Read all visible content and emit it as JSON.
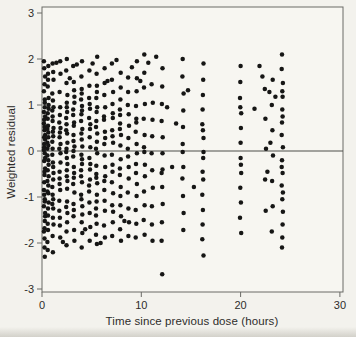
{
  "figure": {
    "page_background": "#f3f2ed",
    "plot_background": "#f7f6f1",
    "axis_color": "#6a6a66",
    "zero_line_color": "#4e4e4a",
    "marker_color": "#161615",
    "text_color": "#2e2d2b",
    "marker_radius": 2.25
  },
  "chart_data": {
    "type": "scatter",
    "title": "",
    "xlabel": "Time since previous dose (hours)",
    "ylabel": "Weighted residual",
    "xlim": [
      0,
      30
    ],
    "ylim": [
      -3,
      3
    ],
    "grid": false,
    "legend": "none",
    "reference_line_y": 0,
    "x_ticks": [
      0,
      10,
      20,
      30
    ],
    "x_tick_labels": [
      "0",
      "10",
      "20",
      "30"
    ],
    "y_ticks": [
      3,
      2,
      1,
      0,
      -1,
      -2,
      -3
    ],
    "y_tick_labels": [
      "3",
      "2",
      "1",
      "0",
      "-1",
      "-2",
      "-3"
    ],
    "clusters": [
      {
        "x": 0.25,
        "y": [
          1.95,
          -0.52,
          1.62,
          0.08,
          -1.05,
          1.3,
          -1.68,
          0.75,
          -0.22,
          1.12,
          -0.85,
          0.45,
          -1.35,
          1.8,
          -0.05,
          0.6,
          -1.9,
          0.25,
          -0.68,
          0.95,
          -1.2,
          1.45,
          -0.38,
          0.15,
          -1.52,
          0.85,
          -2.1,
          0.35,
          -0.95,
          1.05,
          -1.75,
          0.52,
          -0.15,
          0.68,
          -1.1,
          0.02,
          -0.45,
          -1.42,
          0.3,
          -2.3
        ]
      },
      {
        "x": 0.6,
        "y": [
          1.85,
          -1.98,
          0.55,
          -0.3,
          1.4,
          -0.75,
          0.18,
          -1.25,
          0.92,
          -1.58,
          0.4,
          -0.1,
          1.68,
          -0.55,
          0.7,
          -0.92,
          0.05,
          -1.4,
          1.15,
          -2.15,
          0.3,
          -0.65,
          1.55,
          -1.12,
          0.82,
          -0.2,
          0.48,
          -1.72,
          1.0,
          -0.42,
          0.12,
          -0.88
        ]
      },
      {
        "x": 1.1,
        "y": [
          1.9,
          -0.62,
          1.25,
          -1.45,
          0.5,
          0.05,
          -1.05,
          0.88,
          -0.25,
          1.55,
          -1.85,
          0.32,
          -0.78,
          1.1,
          -0.48,
          0.65,
          -1.25,
          0.2,
          -2.2,
          0.95,
          -0.95,
          1.72,
          -0.08,
          0.42,
          -1.6,
          0.75,
          -0.35,
          -1.15
        ]
      },
      {
        "x": 1.8,
        "y": [
          1.68,
          -0.45,
          0.95,
          -1.3,
          0.4,
          -0.05,
          1.28,
          -0.85,
          0.62,
          -1.62,
          0.15,
          -0.6,
          1.95,
          -1.08,
          0.78,
          -0.25,
          0.3,
          -1.88,
          0.05,
          -1.45,
          0.5,
          -0.72
        ]
      },
      {
        "x": 2.5,
        "y": [
          2.0,
          -0.28,
          1.48,
          -1.1,
          0.72,
          -0.55,
          1.22,
          -1.75,
          0.38,
          -0.02,
          0.95,
          -1.35,
          0.58,
          -0.82,
          1.75,
          -0.42,
          0.18,
          -2.05,
          0.85,
          -1.22,
          1.05,
          -0.65,
          0.05,
          -1.55,
          0.45,
          -0.15
        ]
      },
      {
        "x": 3.2,
        "y": [
          1.85,
          -0.58,
          1.18,
          -1.42,
          0.62,
          -0.12,
          1.5,
          -0.9,
          0.35,
          -1.72,
          0.9,
          -0.35,
          0.1,
          -1.15,
          1.32,
          -0.72,
          0.55,
          -1.95,
          0.22,
          -0.48,
          0.78,
          -1.28,
          1.05,
          0.0
        ]
      },
      {
        "x": 4.0,
        "y": [
          1.95,
          -0.42,
          1.35,
          -1.2,
          0.8,
          -0.68,
          1.12,
          -1.55,
          0.48,
          -0.08,
          0.98,
          -0.95,
          0.25,
          -1.78,
          1.62,
          -0.28,
          0.65,
          -2.1,
          0.1,
          -1.05,
          0.88,
          -0.55,
          1.25,
          -1.38,
          0.38,
          -0.18
        ]
      },
      {
        "x": 4.8,
        "y": [
          1.75,
          -0.62,
          1.15,
          -1.35,
          0.58,
          -0.15,
          0.92,
          -0.88,
          0.3,
          -1.65,
          1.42,
          -0.4,
          0.72,
          -1.95,
          0.08,
          -1.12,
          0.48,
          -0.75,
          1.02,
          -0.28
        ]
      },
      {
        "x": 5.5,
        "y": [
          2.05,
          -0.5,
          1.42,
          -1.25,
          0.85,
          -0.05,
          1.15,
          -0.95,
          0.52,
          -1.58,
          0.95,
          -0.32,
          0.2,
          -1.82,
          1.68,
          -0.7,
          0.65,
          -2.02,
          0.05,
          -1.1,
          0.38,
          -0.58,
          1.28,
          -1.4
        ]
      },
      {
        "x": 6.3,
        "y": [
          1.8,
          -0.55,
          1.22,
          -1.3,
          0.68,
          -0.1,
          0.95,
          -0.85,
          0.42,
          -1.62,
          1.48,
          -0.35,
          0.15,
          -1.88,
          0.75,
          -1.08,
          0.28,
          -0.65
        ]
      },
      {
        "x": 7.1,
        "y": [
          1.9,
          -0.45,
          1.28,
          -1.18,
          0.72,
          -0.08,
          1.02,
          -0.92,
          0.45,
          -1.55,
          1.55,
          -0.3,
          0.18,
          -1.85,
          0.82,
          -0.68,
          0.32,
          -1.32
        ]
      },
      {
        "x": 7.9,
        "y": [
          1.7,
          -0.52,
          1.12,
          -1.42,
          0.6,
          -0.18,
          0.9,
          -0.98,
          0.35,
          -1.7,
          1.38,
          -0.38,
          0.12,
          -1.95,
          0.78,
          -0.78,
          0.48,
          -1.18
        ]
      },
      {
        "x": 8.7,
        "y": [
          1.6,
          -0.6,
          1.0,
          -1.25,
          0.55,
          -0.12,
          0.8,
          -0.9,
          0.28,
          -1.55,
          1.28,
          -0.35,
          0.05,
          -1.85
        ]
      },
      {
        "x": 9.5,
        "y": [
          1.95,
          -0.48,
          1.3,
          -1.28,
          0.7,
          -0.05,
          0.98,
          -0.98,
          0.42,
          -1.58,
          1.58,
          -0.28,
          0.15,
          -1.88,
          0.62,
          -0.72
        ]
      },
      {
        "x": 10.3,
        "y": [
          2.1,
          -0.55,
          1.38,
          -1.18,
          0.7,
          -0.02,
          1.02,
          -0.88,
          0.35,
          -1.5,
          1.7,
          -0.3,
          0.08,
          -1.82
        ]
      },
      {
        "x": 11.1,
        "y": [
          1.45,
          -0.42,
          1.05,
          -1.2,
          0.68,
          -0.05,
          0.32,
          -0.8,
          -1.6,
          -1.95
        ]
      },
      {
        "x": 12.1,
        "y": [
          1.8,
          -0.48,
          1.4,
          -1.15,
          1.02,
          -0.05,
          0.65,
          -0.78,
          0.3,
          -1.55,
          -0.4,
          -1.95,
          -2.68
        ]
      },
      {
        "x": 14.2,
        "y": [
          2.0,
          -0.35,
          1.62,
          -0.98,
          1.25,
          -0.02,
          0.88,
          -0.6,
          0.52,
          -1.35,
          0.15,
          -1.72
        ]
      },
      {
        "x": 16.2,
        "y": [
          1.9,
          -0.45,
          1.55,
          -0.95,
          1.22,
          -0.02,
          0.9,
          -0.62,
          0.58,
          -1.28,
          0.28,
          -1.6,
          -0.15,
          -1.92,
          0.45,
          -2.27
        ]
      },
      {
        "x": 20.0,
        "y": [
          1.85,
          -0.48,
          1.5,
          -1.12,
          1.15,
          -0.15,
          0.82,
          -0.8,
          0.5,
          -1.45,
          0.18,
          -1.78,
          0.95,
          -0.3
        ]
      },
      {
        "x": 22.5,
        "y": [
          1.35,
          0.7,
          0.05,
          -0.62,
          -1.3
        ]
      },
      {
        "x": 23.2,
        "y": [
          1.55,
          1.0,
          0.45,
          -0.1,
          -0.65,
          -1.2,
          -1.75
        ]
      },
      {
        "x": 24.2,
        "y": [
          2.1,
          -0.48,
          1.78,
          -1.05,
          1.48,
          -0.2,
          1.18,
          -0.75,
          0.9,
          -1.32,
          0.62,
          -1.6,
          0.35,
          -1.88,
          0.08,
          -2.1,
          0.75,
          -0.35,
          1.3,
          -0.9
        ]
      }
    ],
    "singles": [
      [
        1.45,
        1.92
      ],
      [
        2.1,
        -1.98
      ],
      [
        2.8,
        1.58
      ],
      [
        3.5,
        1.88
      ],
      [
        4.35,
        -1.7
      ],
      [
        5.1,
        1.9
      ],
      [
        5.9,
        -2.0
      ],
      [
        6.6,
        1.52
      ],
      [
        7.5,
        1.98
      ],
      [
        8.3,
        -1.52
      ],
      [
        9.05,
        1.82
      ],
      [
        9.9,
        1.52
      ],
      [
        10.7,
        1.92
      ],
      [
        11.5,
        2.05
      ],
      [
        12.6,
        0.95
      ],
      [
        13.1,
        -0.35
      ],
      [
        13.5,
        0.6
      ],
      [
        14.7,
        1.32
      ],
      [
        15.3,
        -0.78
      ],
      [
        21.4,
        0.92
      ],
      [
        21.9,
        1.85
      ],
      [
        22.2,
        1.62
      ],
      [
        22.9,
        1.28
      ],
      [
        23.5,
        1.18
      ],
      [
        22.7,
        -0.45
      ],
      [
        23.0,
        0.18
      ]
    ]
  }
}
